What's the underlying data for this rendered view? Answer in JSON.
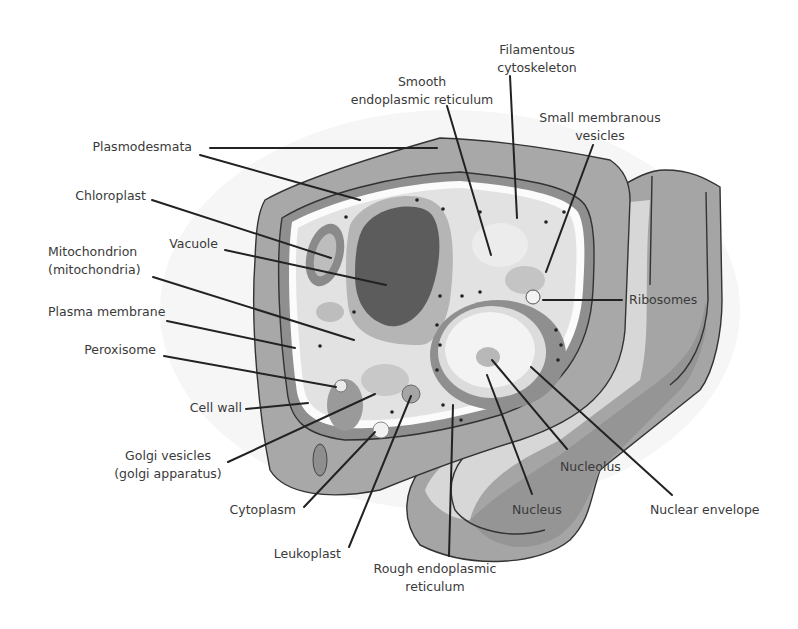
{
  "diagram": {
    "colors": {
      "background": "#ffffff",
      "cell_wall_outer": "#a9a9a9",
      "cell_wall_inner": "#8e8e8e",
      "cytoplasm": "#e4e4e4",
      "vacuole_outer": "#b0b0b0",
      "vacuole_inner": "#5c5c5c",
      "nucleus": "#f0f0f0",
      "side_face_light": "#d8d8d8",
      "side_face_dark": "#9a9a9a",
      "label_text": "#3a3a3a",
      "leader_line": "#222222"
    },
    "labels": [
      {
        "id": "smooth-er",
        "lines": [
          "Smooth",
          "endoplasmic reticulum"
        ],
        "x": 422,
        "y": 86,
        "anchor": "middle",
        "leader": [
          [
            447,
            106
          ],
          [
            491,
            255
          ]
        ]
      },
      {
        "id": "filamentous-cytoskeleton",
        "lines": [
          "Filamentous",
          "cytoskeleton"
        ],
        "x": 537,
        "y": 54,
        "anchor": "middle",
        "leader": [
          [
            510,
            76
          ],
          [
            517,
            218
          ]
        ]
      },
      {
        "id": "small-membranous-vesicles",
        "lines": [
          "Small membranous",
          "vesicles"
        ],
        "x": 600,
        "y": 122,
        "anchor": "middle",
        "leader": [
          [
            593,
            145
          ],
          [
            546,
            272
          ]
        ]
      },
      {
        "id": "plasmodesmata",
        "lines": [
          "Plasmodesmata"
        ],
        "x": 192,
        "y": 151,
        "anchor": "end",
        "leader": [
          [
            210,
            148
          ],
          [
            437,
            148
          ]
        ],
        "leader2": [
          [
            200,
            155
          ],
          [
            360,
            200
          ]
        ]
      },
      {
        "id": "chloroplast",
        "lines": [
          "Chloroplast"
        ],
        "x": 146,
        "y": 200,
        "anchor": "end",
        "leader": [
          [
            152,
            200
          ],
          [
            331,
            258
          ]
        ]
      },
      {
        "id": "vacuole",
        "lines": [
          "Vacuole"
        ],
        "x": 218,
        "y": 248,
        "anchor": "end",
        "leader": [
          [
            225,
            250
          ],
          [
            386,
            285
          ]
        ]
      },
      {
        "id": "mitochondrion",
        "lines": [
          "Mitochondrion",
          "(mitochondria)"
        ],
        "x": 48,
        "y": 256,
        "anchor": "start",
        "leader": [
          [
            153,
            277
          ],
          [
            354,
            340
          ]
        ]
      },
      {
        "id": "plasma-membrane",
        "lines": [
          "Plasma membrane"
        ],
        "x": 48,
        "y": 316,
        "anchor": "start",
        "leader": [
          [
            167,
            321
          ],
          [
            295,
            348
          ]
        ]
      },
      {
        "id": "peroxisome",
        "lines": [
          "Peroxisome"
        ],
        "x": 156,
        "y": 354,
        "anchor": "end",
        "leader": [
          [
            164,
            356
          ],
          [
            336,
            387
          ]
        ]
      },
      {
        "id": "cell-wall",
        "lines": [
          "Cell wall"
        ],
        "x": 242,
        "y": 412,
        "anchor": "end",
        "leader": [
          [
            246,
            409
          ],
          [
            308,
            403
          ]
        ]
      },
      {
        "id": "golgi-vesicles",
        "lines": [
          "Golgi vesicles",
          "(golgi apparatus)"
        ],
        "x": 168,
        "y": 460,
        "anchor": "middle",
        "leader": [
          [
            228,
            462
          ],
          [
            375,
            394
          ]
        ]
      },
      {
        "id": "cytoplasm",
        "lines": [
          "Cytoplasm"
        ],
        "x": 296,
        "y": 514,
        "anchor": "end",
        "leader": [
          [
            304,
            507
          ],
          [
            375,
            432
          ]
        ]
      },
      {
        "id": "leukoplast",
        "lines": [
          "Leukoplast"
        ],
        "x": 341,
        "y": 558,
        "anchor": "end",
        "leader": [
          [
            349,
            547
          ],
          [
            411,
            396
          ]
        ]
      },
      {
        "id": "rough-er",
        "lines": [
          "Rough endoplasmic",
          "reticulum"
        ],
        "x": 435,
        "y": 573,
        "anchor": "middle",
        "leader": [
          [
            449,
            556
          ],
          [
            453,
            405
          ]
        ]
      },
      {
        "id": "ribosomes",
        "lines": [
          "Ribosomes"
        ],
        "x": 629,
        "y": 304,
        "anchor": "start",
        "leader": [
          [
            543,
            300
          ],
          [
            622,
            300
          ]
        ]
      },
      {
        "id": "nucleolus",
        "lines": [
          "Nucleolus"
        ],
        "x": 560,
        "y": 471,
        "anchor": "start",
        "leader": [
          [
            492,
            360
          ],
          [
            567,
            449
          ]
        ]
      },
      {
        "id": "nucleus",
        "lines": [
          "Nucleus"
        ],
        "x": 512,
        "y": 514,
        "anchor": "start",
        "leader": [
          [
            487,
            375
          ],
          [
            532,
            494
          ]
        ]
      },
      {
        "id": "nuclear-envelope",
        "lines": [
          "Nuclear envelope"
        ],
        "x": 650,
        "y": 514,
        "anchor": "start",
        "leader": [
          [
            531,
            367
          ],
          [
            672,
            495
          ]
        ]
      }
    ]
  }
}
